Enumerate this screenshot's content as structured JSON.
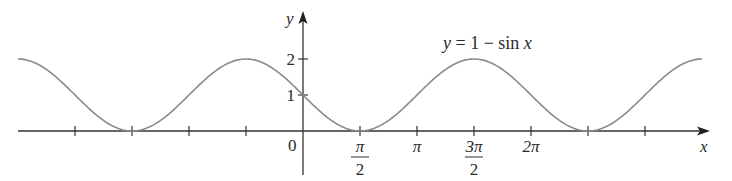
{
  "chart_data": {
    "type": "line",
    "title": "",
    "equation_label": "y = 1 − sin x",
    "xlabel": "x",
    "ylabel": "y",
    "function": "1 - sin(x)",
    "x_range": [
      -7.854,
      10.996
    ],
    "ylim": [
      0,
      2
    ],
    "grid": false,
    "legend": "none",
    "x_ticks": [
      {
        "value": -6.283,
        "label": ""
      },
      {
        "value": -4.712,
        "label": ""
      },
      {
        "value": -3.1416,
        "label": ""
      },
      {
        "value": -1.5708,
        "label": ""
      },
      {
        "value": 1.5708,
        "label": "π/2",
        "num": "π",
        "den": "2"
      },
      {
        "value": 3.1416,
        "label": "π"
      },
      {
        "value": 4.712,
        "label": "3π/2",
        "num": "3π",
        "den": "2"
      },
      {
        "value": 6.283,
        "label": "2π"
      },
      {
        "value": 7.854,
        "label": ""
      },
      {
        "value": 9.425,
        "label": ""
      }
    ],
    "y_ticks": [
      {
        "value": 1,
        "label": "1"
      },
      {
        "value": 2,
        "label": "2"
      }
    ],
    "origin_label": "0",
    "key_points": [
      {
        "x": -7.854,
        "y": 2
      },
      {
        "x": -4.712,
        "y": 0
      },
      {
        "x": -1.5708,
        "y": 2
      },
      {
        "x": 0,
        "y": 1
      },
      {
        "x": 1.5708,
        "y": 0
      },
      {
        "x": 4.712,
        "y": 2
      },
      {
        "x": 7.854,
        "y": 0
      },
      {
        "x": 10.996,
        "y": 2
      }
    ],
    "colors": {
      "curve": "#8a8a8a",
      "axes": "#333333",
      "text": "#2a2a2a"
    }
  }
}
